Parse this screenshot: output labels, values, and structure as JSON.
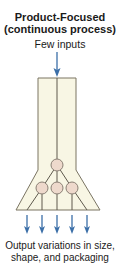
{
  "title": {
    "line1": "Product-Focused",
    "line2": "(continuous process)"
  },
  "input_label": "Few inputs",
  "output_label": {
    "line1": "Output variations in size,",
    "line2": "shape, and packaging"
  },
  "colors": {
    "funnel_fill": "#f8f6e4",
    "funnel_stroke": "#7a7463",
    "node_fill": "#eed9cc",
    "node_stroke": "#8a7f74",
    "arrow": "#3b6fa8",
    "text": "#1a1a1a"
  },
  "diagram": {
    "input_arrows": 1,
    "nodes": 4,
    "output_arrows": 5
  }
}
